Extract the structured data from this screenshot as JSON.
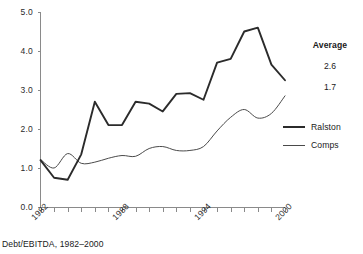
{
  "chart_data": {
    "type": "line",
    "title": "",
    "caption": "Debt/EBITDA, 1982–2000",
    "xlabel": "",
    "ylabel": "",
    "ylim": [
      0.0,
      5.0
    ],
    "xlim": [
      1982,
      2000
    ],
    "grid": false,
    "legend_position": "right",
    "ytick_labels": [
      "5.0",
      "4.0",
      "3.0",
      "2.0",
      "1.0",
      "0.0"
    ],
    "ytick_values": [
      5.0,
      4.0,
      3.0,
      2.0,
      1.0,
      0.0
    ],
    "xtick_labels": [
      "1982",
      "1988",
      "1994",
      "2000"
    ],
    "xtick_values": [
      1982,
      1988,
      1994,
      2000
    ],
    "x": [
      1982,
      1983,
      1984,
      1985,
      1986,
      1987,
      1988,
      1989,
      1990,
      1991,
      1992,
      1993,
      1994,
      1995,
      1996,
      1997,
      1998,
      1999,
      2000
    ],
    "series": [
      {
        "name": "Ralston",
        "average": "2.6",
        "values": [
          1.2,
          0.75,
          0.7,
          1.35,
          2.7,
          2.1,
          2.1,
          2.7,
          2.65,
          2.45,
          2.9,
          2.92,
          2.75,
          3.7,
          3.8,
          4.5,
          4.6,
          3.65,
          3.25
        ]
      },
      {
        "name": "Comps",
        "average": "1.7",
        "values": [
          1.22,
          1.0,
          1.37,
          1.12,
          1.15,
          1.25,
          1.32,
          1.3,
          1.5,
          1.55,
          1.45,
          1.45,
          1.55,
          1.95,
          2.3,
          2.5,
          2.28,
          2.4,
          2.85
        ]
      }
    ]
  },
  "average_panel": {
    "title": "Average",
    "values": [
      "2.6",
      "1.7"
    ]
  },
  "legend": {
    "entries": [
      {
        "label": "Ralston",
        "style": "thick"
      },
      {
        "label": "Comps",
        "style": "thin"
      }
    ]
  }
}
